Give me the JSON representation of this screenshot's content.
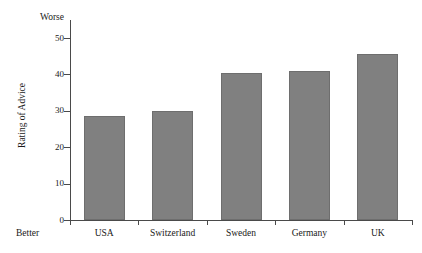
{
  "chart_data": {
    "type": "bar",
    "title": "",
    "subtitle": "",
    "xlabel": "",
    "ylabel": "Rating of Advice",
    "categories": [
      "USA",
      "Switzerland",
      "Sweden",
      "Germany",
      "UK"
    ],
    "values": [
      28.5,
      30,
      40.5,
      41,
      45.5
    ],
    "series": [
      {
        "name": "Rating of Advice",
        "values": [
          28.5,
          30,
          40.5,
          41,
          45.5
        ]
      }
    ],
    "ylim": [
      0,
      52
    ],
    "yticks": [
      0,
      10,
      20,
      30,
      40,
      50
    ],
    "ytick_labels": [
      "0",
      "10",
      "20",
      "30",
      "40",
      "50"
    ],
    "grid": false,
    "legend": false,
    "legend_position": "none",
    "annotations": {
      "axis_high_end": "Worse",
      "axis_low_end": "Better"
    },
    "bar_color": "#808080",
    "bar_edge_color": "#6e6e6e",
    "axis_color": "#4a4a4a",
    "background_color": "#ffffff"
  },
  "chart": {
    "y_axis_title": "Rating of Advice",
    "worse_label": "Worse",
    "better_label": "Better"
  }
}
